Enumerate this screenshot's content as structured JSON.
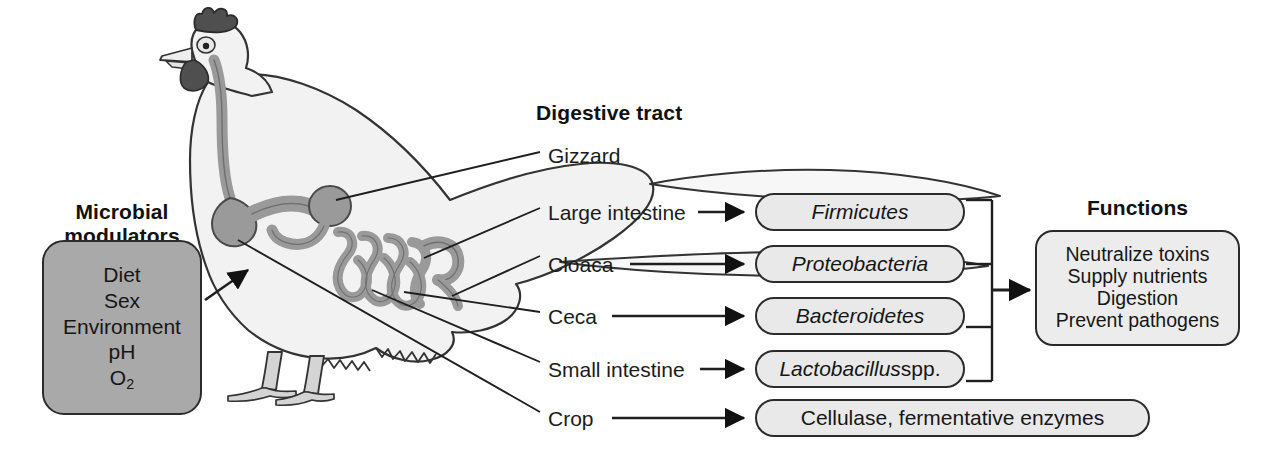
{
  "figure": {
    "type": "scientific-diagram",
    "background_color": "#ffffff"
  },
  "modulators": {
    "title": "Microbial\nmodulators",
    "title_line1": "Microbial",
    "title_line2": "modulators",
    "box_fill": "#a9a9a9",
    "items": [
      {
        "label": "Diet"
      },
      {
        "label": "Sex"
      },
      {
        "label": "Environment"
      },
      {
        "label": "pH"
      },
      {
        "label": "O",
        "subscript": "2"
      }
    ]
  },
  "digestive_tract": {
    "title": "Digestive tract",
    "labels": [
      {
        "name": "Gizzard",
        "has_arrow": false
      },
      {
        "name": "Large intestine",
        "has_arrow": true
      },
      {
        "name": "Cloaca",
        "has_arrow": true
      },
      {
        "name": "Ceca",
        "has_arrow": true
      },
      {
        "name": "Small intestine",
        "has_arrow": true
      },
      {
        "name": "Crop",
        "has_arrow": true
      }
    ]
  },
  "taxa": [
    {
      "text": "Firmicutes",
      "style": "italic",
      "suffix": ""
    },
    {
      "text": "Proteobacteria",
      "style": "italic",
      "suffix": ""
    },
    {
      "text": "Bacteroidetes",
      "style": "italic",
      "suffix": ""
    },
    {
      "text": "Lactobacillus",
      "style": "italic",
      "suffix": " spp."
    }
  ],
  "enzymes": {
    "text": "Cellulase, fermentative enzymes",
    "style": "roman"
  },
  "functions": {
    "title": "Functions",
    "box_fill": "#ececec",
    "items": [
      {
        "label": "Neutralize toxins"
      },
      {
        "label": "Supply nutrients"
      },
      {
        "label": "Digestion"
      },
      {
        "label": "Prevent pathogens"
      }
    ]
  },
  "illustration": {
    "name": "chicken-anatomy-illustration",
    "body_fill": "#f2f2f2",
    "tract_fill": "#9a9a9a",
    "comb_fill": "#4f4f4f",
    "leg_fill": "#d4d4d4",
    "outline_color": "#333333"
  },
  "colors": {
    "line": "#1f1f1f",
    "pill_fill": "#e9e9e9",
    "box_border": "#2b2b2b"
  }
}
